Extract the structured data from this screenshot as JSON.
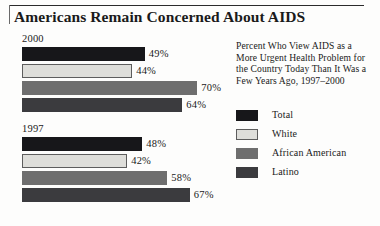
{
  "title": "Americans Remain Concerned About AIDS",
  "caption": "Percent Who View AIDS as a More Urgent Health Problem for the Country Today Than It Was a Few Years Ago, 1997–2000",
  "legend": {
    "items": [
      {
        "label": "Total",
        "color": "#17171a"
      },
      {
        "label": "White",
        "color": "#dededa"
      },
      {
        "label": "African American",
        "color": "#6e6e6e"
      },
      {
        "label": "Latino",
        "color": "#3b3b3e"
      }
    ]
  },
  "groups": [
    {
      "year": "2000",
      "bars": [
        {
          "series": "Total",
          "value": 49,
          "label": "49%"
        },
        {
          "series": "White",
          "value": 44,
          "label": "44%"
        },
        {
          "series": "African American",
          "value": 70,
          "label": "70%"
        },
        {
          "series": "Latino",
          "value": 64,
          "label": "64%"
        }
      ]
    },
    {
      "year": "1997",
      "bars": [
        {
          "series": "Total",
          "value": 48,
          "label": "48%"
        },
        {
          "series": "White",
          "value": 42,
          "label": "42%"
        },
        {
          "series": "African American",
          "value": 58,
          "label": "58%"
        },
        {
          "series": "Latino",
          "value": 67,
          "label": "67%"
        }
      ]
    }
  ],
  "chart_data": {
    "type": "bar",
    "title": "Americans Remain Concerned About AIDS",
    "subtitle": "Percent Who View AIDS as a More Urgent Health Problem for the Country Today Than It Was a Few Years Ago, 1997–2000",
    "orientation": "horizontal",
    "grouped_by": "year",
    "categories": [
      "2000",
      "1997"
    ],
    "series": [
      {
        "name": "Total",
        "values": [
          49,
          48
        ],
        "color": "#17171a"
      },
      {
        "name": "White",
        "values": [
          44,
          42
        ],
        "color": "#dededa"
      },
      {
        "name": "African American",
        "values": [
          70,
          58
        ],
        "color": "#6e6e6e"
      },
      {
        "name": "Latino",
        "values": [
          64,
          67
        ],
        "color": "#3b3b3e"
      }
    ],
    "value_labels": [
      "49%",
      "44%",
      "70%",
      "64%",
      "48%",
      "42%",
      "58%",
      "67%"
    ],
    "xlabel": "",
    "ylabel": "",
    "xlim": [
      0,
      100
    ],
    "unit": "percent",
    "grid": false,
    "axis_visible": false,
    "legend_position": "right"
  }
}
